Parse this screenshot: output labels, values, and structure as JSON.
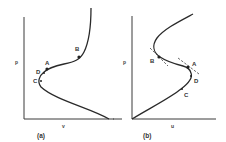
{
  "panels": [
    {
      "caption": "(a)",
      "y_axis_label": "p",
      "x_axis_label": "v",
      "points": {
        "A": "A",
        "B": "B",
        "C": "C",
        "D": "D"
      }
    },
    {
      "caption": "(b)",
      "y_axis_label": "p",
      "x_axis_label": "u",
      "points": {
        "A": "A",
        "B": "B",
        "C": "C",
        "D": "D"
      }
    }
  ]
}
